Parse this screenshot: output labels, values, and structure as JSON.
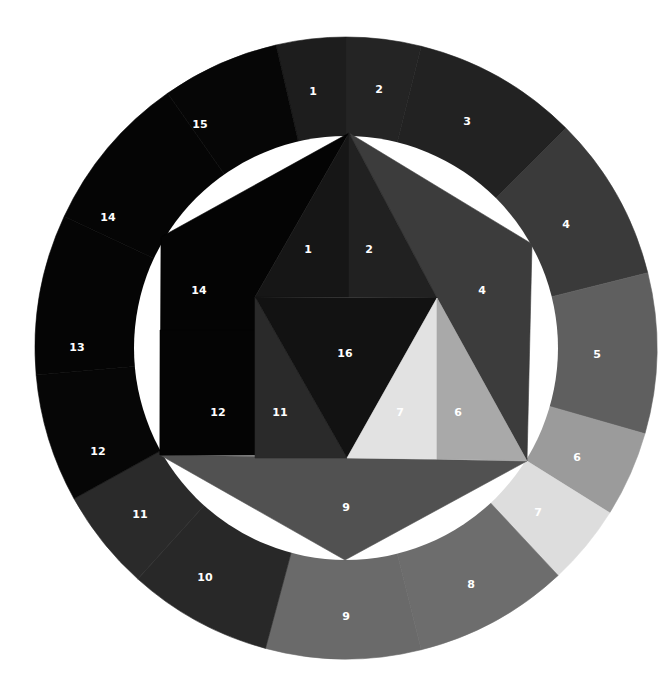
{
  "figure": {
    "center": [
      346,
      348
    ],
    "outer_radius": 311,
    "inner_radius": 212,
    "background": "#ffffff",
    "label_color": "#ffffff"
  },
  "ring_segments": [
    {
      "label": "1",
      "start": -103,
      "end": -90,
      "color": "#1d1d1d",
      "label_pos": [
        313,
        92
      ]
    },
    {
      "label": "2",
      "start": -90,
      "end": -76,
      "color": "#242424",
      "label_pos": [
        379,
        90
      ]
    },
    {
      "label": "3",
      "start": -76,
      "end": -45,
      "color": "#222222",
      "label_pos": [
        467,
        122
      ]
    },
    {
      "label": "4",
      "start": -45,
      "end": -14,
      "color": "#3a3a3a",
      "label_pos": [
        566,
        225
      ]
    },
    {
      "label": "5",
      "start": -14,
      "end": 16,
      "color": "#5f5f5f",
      "label_pos": [
        597,
        355
      ]
    },
    {
      "label": "6",
      "start": 16,
      "end": 32,
      "color": "#9b9b9b",
      "label_pos": [
        577,
        458
      ]
    },
    {
      "label": "7",
      "start": 32,
      "end": 47,
      "color": "#dddddd",
      "label_pos": [
        538,
        513
      ]
    },
    {
      "label": "8",
      "start": 47,
      "end": 76,
      "color": "#6d6d6d",
      "label_pos": [
        471,
        585
      ]
    },
    {
      "label": "9",
      "start": 76,
      "end": 105,
      "color": "#6a6a6a",
      "label_pos": [
        346,
        617
      ]
    },
    {
      "label": "10",
      "start": 105,
      "end": 132,
      "color": "#282828",
      "label_pos": [
        205,
        578
      ]
    },
    {
      "label": "11",
      "start": 132,
      "end": 151,
      "color": "#2a2a2a",
      "label_pos": [
        140,
        515
      ]
    },
    {
      "label": "12",
      "start": 151,
      "end": 175,
      "color": "#060606",
      "label_pos": [
        98,
        452
      ]
    },
    {
      "label": "13",
      "start": 175,
      "end": 205,
      "color": "#050505",
      "label_pos": [
        77,
        348
      ]
    },
    {
      "label": "14",
      "start": 205,
      "end": 235,
      "color": "#050505",
      "label_pos": [
        108,
        218
      ]
    },
    {
      "label": "15",
      "start": 235,
      "end": 257,
      "color": "#060606",
      "label_pos": [
        200,
        125
      ]
    }
  ],
  "inner_regions": [
    {
      "label": "9",
      "color": "#515151",
      "points": [
        [
          160,
          455
        ],
        [
          527,
          461
        ],
        [
          345,
          560
        ]
      ],
      "label_pos": [
        346,
        508
      ]
    },
    {
      "label": "14",
      "color": "#040404",
      "points": [
        [
          349,
          133
        ],
        [
          161,
          237
        ],
        [
          160,
          455
        ],
        [
          255,
          455
        ],
        [
          255,
          297
        ]
      ],
      "label_pos": [
        199,
        291
      ]
    },
    {
      "label": "12",
      "color": "#040404",
      "points": [
        [
          160,
          330
        ],
        [
          255,
          330
        ],
        [
          255,
          455
        ],
        [
          160,
          455
        ]
      ],
      "label_pos": [
        218,
        413
      ]
    },
    {
      "label": "11",
      "color": "#2a2a2a",
      "points": [
        [
          255,
          297
        ],
        [
          347,
          458
        ],
        [
          255,
          458
        ]
      ],
      "label_pos": [
        280,
        413
      ]
    },
    {
      "label": "4",
      "color": "#3c3c3c",
      "points": [
        [
          349,
          133
        ],
        [
          532,
          244
        ],
        [
          527,
          461
        ],
        [
          437,
          298
        ]
      ],
      "label_pos": [
        482,
        291
      ]
    },
    {
      "label": "1",
      "color": "#161616",
      "points": [
        [
          349,
          133
        ],
        [
          349,
          297
        ],
        [
          255,
          297
        ]
      ],
      "label_pos": [
        308,
        250
      ]
    },
    {
      "label": "2",
      "color": "#212121",
      "points": [
        [
          349,
          133
        ],
        [
          437,
          298
        ],
        [
          349,
          297
        ]
      ],
      "label_pos": [
        369,
        250
      ]
    },
    {
      "label": "16",
      "color": "#121212",
      "points": [
        [
          255,
          297
        ],
        [
          437,
          298
        ],
        [
          347,
          458
        ]
      ],
      "label_pos": [
        345,
        354
      ]
    },
    {
      "label": "7",
      "color": "#e2e2e2",
      "points": [
        [
          437,
          298
        ],
        [
          437,
          459
        ],
        [
          347,
          458
        ]
      ],
      "label_pos": [
        400,
        413
      ]
    },
    {
      "label": "6",
      "color": "#a9a9a9",
      "points": [
        [
          437,
          298
        ],
        [
          527,
          461
        ],
        [
          437,
          459
        ]
      ],
      "label_pos": [
        458,
        413
      ]
    }
  ]
}
